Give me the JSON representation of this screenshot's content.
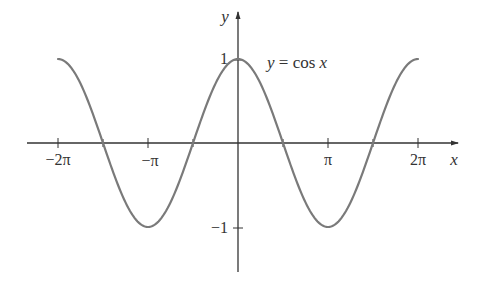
{
  "chart_data": {
    "type": "line",
    "title": "",
    "function_label": "y = cos x",
    "xlabel": "x",
    "ylabel": "y",
    "x_tick_labels": [
      "−2π",
      "−π",
      "π",
      "2π"
    ],
    "x_tick_values": [
      -6.2832,
      -3.1416,
      3.1416,
      6.2832
    ],
    "y_tick_labels": [
      "1",
      "−1"
    ],
    "y_tick_values": [
      1,
      -1
    ],
    "xlim": [
      -7.6,
      7.0
    ],
    "ylim": [
      -1.55,
      1.5
    ],
    "grid": false,
    "legend": "none",
    "series": [
      {
        "name": "y = cos x",
        "x_range": [
          -6.2832,
          6.2832
        ],
        "samples": [
          {
            "x": -6.2832,
            "y": 1
          },
          {
            "x": -4.7124,
            "y": 0
          },
          {
            "x": -3.1416,
            "y": -1
          },
          {
            "x": -1.5708,
            "y": 0
          },
          {
            "x": 0,
            "y": 1
          },
          {
            "x": 1.5708,
            "y": 0
          },
          {
            "x": 3.1416,
            "y": -1
          },
          {
            "x": 4.7124,
            "y": 0
          },
          {
            "x": 6.2832,
            "y": 1
          }
        ]
      }
    ],
    "colors": {
      "curve": "#7a7a7a",
      "axes": "#333333",
      "text": "#333333"
    }
  }
}
